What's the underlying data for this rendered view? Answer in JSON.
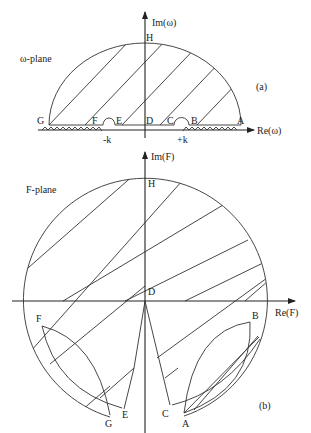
{
  "figure": {
    "panel_a": {
      "plane_label": "ω-plane",
      "panel_tag": "(a)",
      "axis_x_label": "Re(ω)",
      "axis_y_label": "Im(ω)",
      "points": {
        "A": "A",
        "B": "B",
        "C": "C",
        "D": "D",
        "E": "E",
        "F": "F",
        "G": "G",
        "H": "H"
      },
      "branch_points": {
        "minus_k": "-k",
        "plus_k": "+k"
      }
    },
    "panel_b": {
      "plane_label": "F-plane",
      "panel_tag": "(b)",
      "axis_x_label": "Re(F)",
      "axis_y_label": "Im(F)",
      "points": {
        "A": "A",
        "B": "B",
        "C": "C",
        "D": "D",
        "E": "E",
        "F": "F",
        "G": "G",
        "H": "H"
      }
    }
  }
}
